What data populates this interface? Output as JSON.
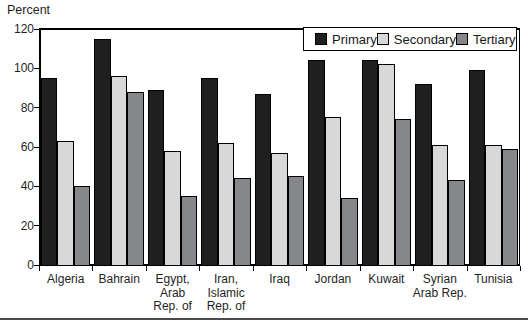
{
  "chart_data": {
    "type": "bar",
    "title": "",
    "ylabel": "Percent",
    "xlabel": "",
    "ylim": [
      0,
      120
    ],
    "yticks": [
      0,
      20,
      40,
      60,
      80,
      100,
      120
    ],
    "grid": false,
    "legend": {
      "position": "top-right-inside",
      "entries": [
        "Primary",
        "Secondary",
        "Tertiary"
      ]
    },
    "categories": [
      "Algeria",
      "Bahrain",
      "Egypt,\nArab\nRep. of",
      "Iran,\nIslamic\nRep. of",
      "Iraq",
      "Jordan",
      "Kuwait",
      "Syrian\nArab Rep.",
      "Tunisia"
    ],
    "series": [
      {
        "name": "Primary",
        "color": "#1f1f1f",
        "values": [
          95,
          115,
          89,
          95,
          87,
          104,
          104,
          92,
          99
        ]
      },
      {
        "name": "Secondary",
        "color": "#d8d8d8",
        "values": [
          63,
          96,
          58,
          62,
          57,
          75,
          102,
          61,
          61
        ]
      },
      {
        "name": "Tertiary",
        "color": "#85878a",
        "values": [
          40,
          88,
          35,
          44,
          45,
          34,
          74,
          43,
          59
        ]
      }
    ],
    "bar_border_color": "#000000",
    "axis_color": "#000000"
  }
}
